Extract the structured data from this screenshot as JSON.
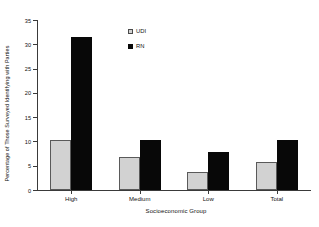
{
  "chart_data": {
    "type": "bar",
    "title": "",
    "categories": [
      "High",
      "Medium",
      "Low",
      "Total"
    ],
    "series": [
      {
        "name": "UDI",
        "values": [
          10.2,
          6.7,
          3.8,
          5.7
        ],
        "color": "#d2d2d2"
      },
      {
        "name": "RN",
        "values": [
          31.5,
          10.3,
          7.8,
          10.3
        ],
        "color": "#080808"
      }
    ],
    "xlabel": "Socioeconomic Group",
    "ylabel": "Percentage of Those Surveyed Identifying with Parties",
    "ylim": [
      0,
      35
    ],
    "yticks": [
      0,
      5,
      10,
      15,
      20,
      25,
      30,
      35
    ],
    "ytick_labels": [
      "0",
      "5",
      "10",
      "15",
      "20",
      "25",
      "30",
      "35"
    ],
    "grid": false,
    "legend_position": "upper-center-right",
    "legend_entries": [
      "UDI",
      "RN"
    ]
  }
}
